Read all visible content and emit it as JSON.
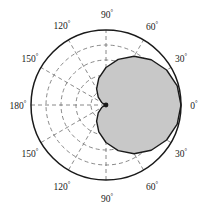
{
  "figure": {
    "type": "polar-plot",
    "title": "",
    "background_color": "#ffffff",
    "outline_color": "#1a1a1a",
    "grid_color": "#6b6b6b",
    "shade_fill_color": "#c8c8c8",
    "shade_stroke_color": "#1a1a1a"
  },
  "geometry": {
    "center_x": 106,
    "center_y": 105,
    "outer_radius": 75,
    "grid_circle_count": 4,
    "radial_spoke_step_deg": 30
  },
  "axis_labels": [
    {
      "id": "label-0",
      "text": "0",
      "degree_symbol": "°",
      "angle_deg": 0,
      "x": 194,
      "y": 107,
      "anchor": "middle"
    },
    {
      "id": "label-30-up",
      "text": "30",
      "degree_symbol": "°",
      "angle_deg": 30,
      "x": 181,
      "y": 60,
      "anchor": "middle"
    },
    {
      "id": "label-60-up",
      "text": "60",
      "degree_symbol": "°",
      "angle_deg": 60,
      "x": 152,
      "y": 28,
      "anchor": "middle"
    },
    {
      "id": "label-90-up",
      "text": "90",
      "degree_symbol": "°",
      "angle_deg": 90,
      "x": 107,
      "y": 16,
      "anchor": "middle"
    },
    {
      "id": "label-120-up",
      "text": "120",
      "degree_symbol": "°",
      "angle_deg": 120,
      "x": 62,
      "y": 27,
      "anchor": "middle"
    },
    {
      "id": "label-150-up",
      "text": "150",
      "degree_symbol": "°",
      "angle_deg": 150,
      "x": 30,
      "y": 60,
      "anchor": "middle"
    },
    {
      "id": "label-180",
      "text": "180",
      "degree_symbol": "°",
      "angle_deg": 180,
      "x": 18,
      "y": 107,
      "anchor": "middle"
    },
    {
      "id": "label-150-dn",
      "text": "150",
      "degree_symbol": "°",
      "angle_deg": -150,
      "x": 30,
      "y": 155,
      "anchor": "middle"
    },
    {
      "id": "label-120-dn",
      "text": "120",
      "degree_symbol": "°",
      "angle_deg": -120,
      "x": 62,
      "y": 188,
      "anchor": "middle"
    },
    {
      "id": "label-90-dn",
      "text": "90",
      "degree_symbol": "°",
      "angle_deg": -90,
      "x": 107,
      "y": 200,
      "anchor": "middle"
    },
    {
      "id": "label-60-dn",
      "text": "60",
      "degree_symbol": "°",
      "angle_deg": -60,
      "x": 152,
      "y": 188,
      "anchor": "middle"
    },
    {
      "id": "label-30-dn",
      "text": "30",
      "degree_symbol": "°",
      "angle_deg": -30,
      "x": 181,
      "y": 155,
      "anchor": "middle"
    }
  ],
  "chart_data": {
    "type": "line",
    "plot_kind": "polar",
    "title": "",
    "xlabel": "",
    "ylabel": "",
    "grid": true,
    "legend": null,
    "theta_unit": "degrees",
    "theta_tick_labels": [
      "0°",
      "30°",
      "60°",
      "90°",
      "120°",
      "150°",
      "180°",
      "150°",
      "120°",
      "90°",
      "60°",
      "30°"
    ],
    "theta_tick_values": [
      0,
      30,
      60,
      90,
      120,
      150,
      180,
      -150,
      -120,
      -90,
      -60,
      -30
    ],
    "r_max": 2,
    "r_grid_values": [
      0.4,
      0.8,
      1.2,
      1.6,
      2.0
    ],
    "series": [
      {
        "name": "cardioid r = 1 + cos(theta)",
        "equation": "r = 1 + cos θ",
        "filled": true,
        "fill_color": "#c8c8c8",
        "stroke_color": "#1a1a1a",
        "theta": [
          0,
          15,
          30,
          45,
          60,
          75,
          90,
          105,
          120,
          135,
          150,
          165,
          180,
          195,
          210,
          225,
          240,
          255,
          270,
          285,
          300,
          315,
          330,
          345,
          360
        ],
        "r": [
          2.0,
          1.966,
          1.866,
          1.707,
          1.5,
          1.259,
          1.0,
          0.741,
          0.5,
          0.293,
          0.134,
          0.034,
          0.0,
          0.034,
          0.134,
          0.293,
          0.5,
          0.741,
          1.0,
          1.259,
          1.5,
          1.707,
          1.866,
          1.966,
          2.0
        ]
      }
    ]
  }
}
